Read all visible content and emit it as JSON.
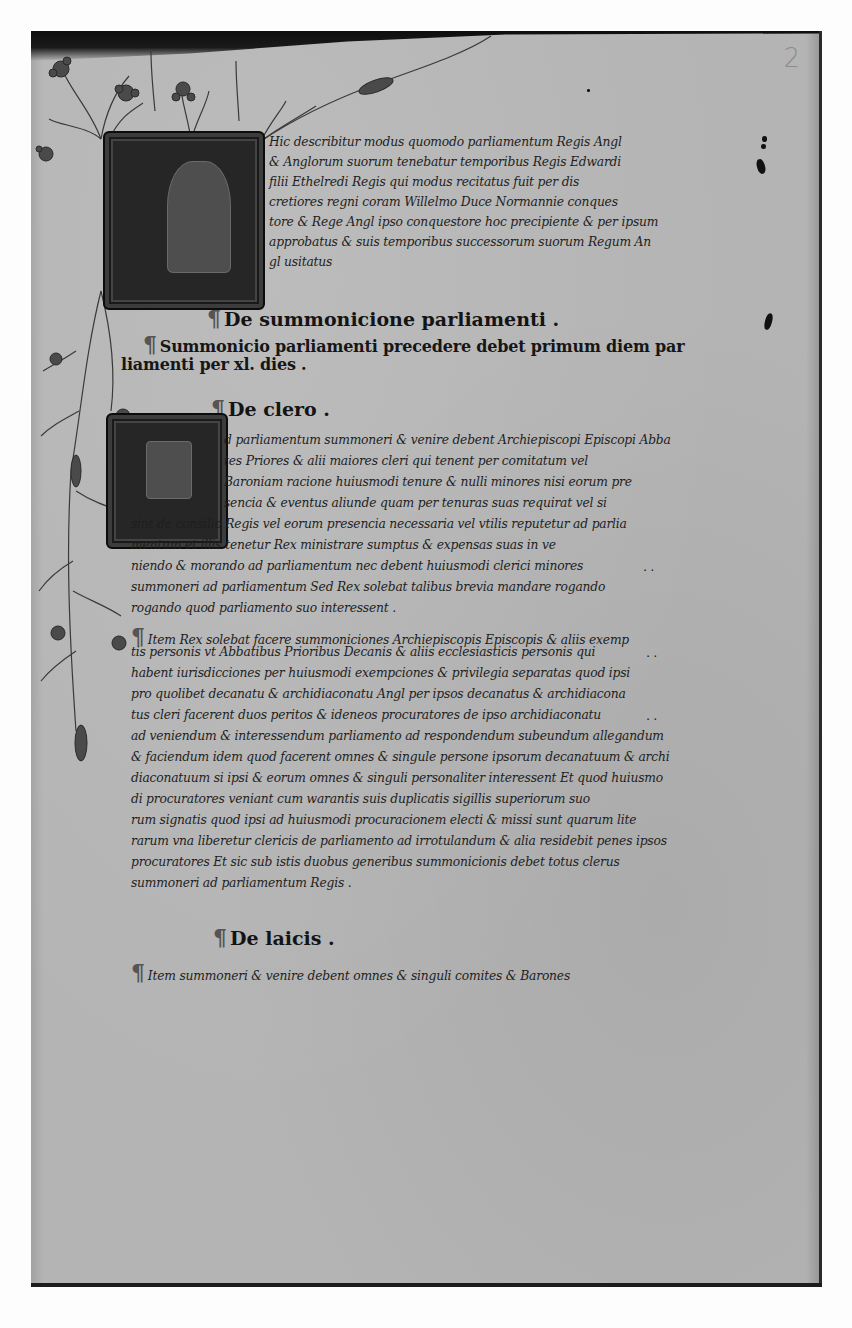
{
  "document": {
    "type": "manuscript-folio",
    "folio_number": "2",
    "script": "Anglicana / Secretary hand",
    "language": "Latin",
    "colors": {
      "parchment": "#b4b4b4",
      "ink": "#1e1e1e",
      "background": "#fdfdfd",
      "illumination_dark": "#262626"
    }
  },
  "initials": [
    {
      "letter": "H",
      "position": "top",
      "lines_spanned": 7
    },
    {
      "letter": "A",
      "position": "middle",
      "lines_spanned": 7
    }
  ],
  "intro": {
    "lines": [
      "Hic describitur modus quomodo parliamentum Regis Angl",
      "& Anglorum suorum tenebatur temporibus Regis Edwardi",
      "filii Ethelredi Regis qui modus recitatus fuit per dis",
      "cretiores regni coram Willelmo Duce Normannie conques",
      "tore & Rege Angl ipso conquestore hoc precipiente & per ipsum",
      "approbatus & suis temporibus successorum suorum Regum An",
      "gl usitatus"
    ]
  },
  "sections": [
    {
      "heading": "De summonicione parliamenti .",
      "paragraphs": [
        {
          "lines": [
            "Summonicio parliamenti precedere debet primum diem par",
            "liamenti per xl. dies ."
          ]
        }
      ]
    },
    {
      "heading": "De clero .",
      "paragraphs": [
        {
          "lines": [
            "d parliamentum summoneri & venire debent Archiepiscopi Episcopi Abba",
            "tes Priores & alii maiores cleri qui tenent per comitatum vel",
            "Baroniam racione huiusmodi tenure & nulli minores nisi eorum pre",
            "sencia & eventus aliunde quam per tenuras suas requirat vel si",
            "sint de consilio Regis vel eorum presencia necessaria vel vtilis reputetur ad parlia",
            "mentum et illis tenetur Rex ministrare sumptus & expensas suas in ve",
            "niendo & morando ad parliamentum nec debent huiusmodi clerici minores",
            "summoneri ad parliamentum Sed Rex solebat talibus brevia mandare rogando",
            "rogando quod parliamento suo interessent ."
          ]
        },
        {
          "lines": [
            "Item Rex solebat facere summoniciones Archiepiscopis Episcopis & aliis exemp",
            "tis personis vt Abbatibus Prioribus Decanis & aliis ecclesiasticis personis qui",
            "habent iurisdicciones per huiusmodi exempciones & privilegia separatas quod ipsi",
            "pro quolibet decanatu & archidiaconatu Angl per ipsos decanatus & archidiacona",
            "tus cleri facerent duos peritos & ideneos procuratores de ipso archidiaconatu",
            "ad veniendum & interessendum parliamento ad respondendum subeundum allegandum",
            "& faciendum idem quod facerent omnes & singule persone ipsorum decanatuum & archi",
            "diaconatuum si ipsi & eorum omnes & singuli personaliter interessent Et quod huiusmo",
            "di procuratores veniant cum warantis suis duplicatis sigillis superiorum suo",
            "rum signatis quod ipsi ad huiusmodi procuracionem electi & missi sunt quarum lite",
            "rarum vna liberetur clericis de parliamento ad irrotulandum & alia residebit penes ipsos",
            "procuratores Et sic sub istis duobus generibus summonicionis debet totus clerus",
            "summoneri ad parliamentum Regis ."
          ]
        }
      ]
    },
    {
      "heading": "De laicis .",
      "paragraphs": [
        {
          "lines": [
            "Item summoneri & venire debent omnes & singuli comites & Barones"
          ]
        }
      ]
    }
  ],
  "margin_marks": [
    {
      "text": "..",
      "line_ref": "clero.0.6"
    },
    {
      "text": "..",
      "line_ref": "clero.1.1"
    },
    {
      "text": "..",
      "line_ref": "clero.1.4"
    }
  ]
}
